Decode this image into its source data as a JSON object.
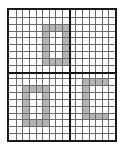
{
  "image": {
    "kind": "grid-worksheet",
    "width": 124,
    "height": 151,
    "background_color": "#ffffff"
  },
  "grid": {
    "frame": {
      "x": 7,
      "y": 8,
      "width": 110,
      "height": 134,
      "border_color": "#1a1a1a",
      "border_width": 2,
      "fill_color": "#fdfdfd"
    },
    "columns": 16,
    "rows": 19,
    "fine_line_color": "#6b6b6b",
    "major_line_color": "#141414",
    "major_vertical_columns": [
      9
    ],
    "major_horizontal_rows": [
      9
    ],
    "shade_color": "#b4b4b4"
  },
  "chart_data": {
    "type": "heatmap",
    "title": "",
    "xlabel": "",
    "ylabel": "",
    "grid": true,
    "legend": "none",
    "cols": 16,
    "rows": 19,
    "xlim": [
      0,
      16
    ],
    "ylim": [
      0,
      19
    ],
    "shaded_value": 1,
    "empty_value": 0,
    "shaded_cells": [
      [
        5,
        2
      ],
      [
        6,
        2
      ],
      [
        7,
        2
      ],
      [
        8,
        2
      ],
      [
        5,
        3
      ],
      [
        8,
        3
      ],
      [
        5,
        4
      ],
      [
        8,
        4
      ],
      [
        5,
        5
      ],
      [
        8,
        5
      ],
      [
        5,
        6
      ],
      [
        8,
        6
      ],
      [
        5,
        7
      ],
      [
        6,
        7
      ],
      [
        7,
        7
      ],
      [
        8,
        7
      ],
      [
        2,
        11
      ],
      [
        3,
        11
      ],
      [
        4,
        11
      ],
      [
        5,
        11
      ],
      [
        2,
        12
      ],
      [
        5,
        12
      ],
      [
        2,
        13
      ],
      [
        5,
        13
      ],
      [
        2,
        14
      ],
      [
        5,
        14
      ],
      [
        2,
        15
      ],
      [
        5,
        15
      ],
      [
        2,
        16
      ],
      [
        3,
        16
      ],
      [
        4,
        16
      ],
      [
        5,
        16
      ],
      [
        11,
        10
      ],
      [
        12,
        10
      ],
      [
        13,
        10
      ],
      [
        14,
        10
      ],
      [
        11,
        11
      ],
      [
        11,
        12
      ],
      [
        11,
        13
      ],
      [
        11,
        14
      ],
      [
        11,
        15
      ],
      [
        12,
        15
      ],
      [
        13,
        15
      ],
      [
        14,
        15
      ]
    ]
  },
  "glyphs": [
    {
      "name": "glyph-top-zero",
      "symbol": "0",
      "quadrant": "top-left",
      "col_start": 5,
      "col_end": 8,
      "row_start": 2,
      "row_end": 7
    },
    {
      "name": "glyph-bottom-left-zero",
      "symbol": "0",
      "quadrant": "bottom-left",
      "col_start": 2,
      "col_end": 5,
      "row_start": 11,
      "row_end": 16
    },
    {
      "name": "glyph-bottom-right-c",
      "symbol": "C",
      "quadrant": "bottom-right",
      "col_start": 11,
      "col_end": 14,
      "row_start": 10,
      "row_end": 15
    }
  ]
}
